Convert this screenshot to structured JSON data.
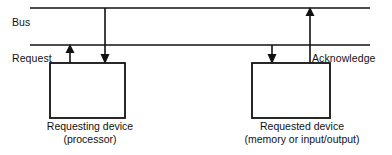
{
  "diagram": {
    "stroke_color": "#111111",
    "background_color": "#ffffff",
    "labels": {
      "bus": "Bus",
      "request": "Request",
      "acknowledge": "Acknowledge"
    },
    "boxes": [
      {
        "id": "requesting-device",
        "caption_line1": "Requesting device",
        "caption_line2": "(processor)"
      },
      {
        "id": "requested-device",
        "caption_line1": "Requested device",
        "caption_line2": "(memory or input/output)"
      }
    ],
    "bus_lines": [
      {
        "id": "bus-line-upper",
        "y": 8,
        "x1": 30,
        "x2": 370
      },
      {
        "id": "bus-line-lower",
        "y": 45,
        "x1": 30,
        "x2": 370
      }
    ],
    "arrows": [
      {
        "id": "request-up-arrow",
        "x": 70,
        "from_y": 63,
        "to_y": 45,
        "direction": "up"
      },
      {
        "id": "left-down-arrow",
        "x": 105,
        "from_y": 8,
        "to_y": 63,
        "direction": "down"
      },
      {
        "id": "right-down-arrow",
        "x": 272,
        "from_y": 45,
        "to_y": 63,
        "direction": "down"
      },
      {
        "id": "acknowledge-up-arrow",
        "x": 310,
        "from_y": 63,
        "to_y": 8,
        "direction": "up"
      }
    ]
  }
}
